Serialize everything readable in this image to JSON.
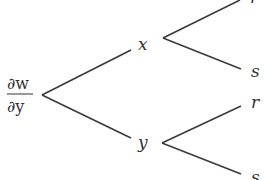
{
  "diagram": {
    "type": "tree",
    "root": {
      "numerator": "∂w",
      "denominator": "∂y"
    },
    "level1": [
      {
        "label": "x",
        "children": [
          "r",
          "s"
        ]
      },
      {
        "label": "y",
        "children": [
          "r",
          "s"
        ]
      }
    ]
  },
  "labels": {
    "root_num": "∂w",
    "root_den": "∂y",
    "x": "x",
    "y": "y",
    "x_r": "r",
    "x_s": "s",
    "y_r": "r",
    "y_s": "s"
  }
}
